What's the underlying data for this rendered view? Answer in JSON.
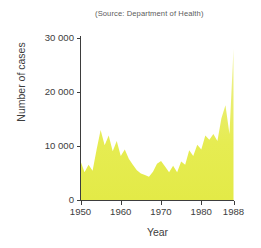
{
  "figure": {
    "source_note": "(Source: Department of Health)",
    "background_color": "#ffffff",
    "axis_color": "#3d3d3d"
  },
  "chart_data": {
    "type": "area",
    "title": "",
    "subtitle": "(Source: Department of Health)",
    "xlabel": "Year",
    "ylabel": "Number of cases",
    "xlim": [
      1950,
      1988
    ],
    "ylim": [
      0,
      31000
    ],
    "grid": false,
    "legend": null,
    "fill_color": "#e6ec49",
    "x_tick_labels": [
      "1950",
      "1960",
      "1970",
      "1980",
      "1988"
    ],
    "x_ticks": [
      1950,
      1960,
      1970,
      1980,
      1988
    ],
    "y_tick_labels": [
      "0",
      "10 000",
      "20 000",
      "30 000"
    ],
    "y_ticks": [
      0,
      10000,
      20000,
      30000
    ],
    "x": [
      1950,
      1951,
      1952,
      1953,
      1954,
      1955,
      1956,
      1957,
      1958,
      1959,
      1960,
      1961,
      1962,
      1963,
      1964,
      1965,
      1966,
      1967,
      1968,
      1969,
      1970,
      1971,
      1972,
      1973,
      1974,
      1975,
      1976,
      1977,
      1978,
      1979,
      1980,
      1981,
      1982,
      1983,
      1984,
      1985,
      1986,
      1987,
      1988
    ],
    "values": [
      7300,
      5200,
      6600,
      5500,
      9400,
      13000,
      10200,
      12000,
      9100,
      11000,
      8200,
      9400,
      7700,
      6600,
      5600,
      5000,
      4700,
      4400,
      5300,
      6800,
      7300,
      6300,
      5200,
      6400,
      5200,
      7200,
      6600,
      9300,
      8200,
      10300,
      9400,
      12000,
      11200,
      12300,
      11000,
      15200,
      17600,
      12300,
      28000
    ],
    "series": [
      {
        "name": "Number of cases",
        "values": [
          7300,
          5200,
          6600,
          5500,
          9400,
          13000,
          10200,
          12000,
          9100,
          11000,
          8200,
          9400,
          7700,
          6600,
          5600,
          5000,
          4700,
          4400,
          5300,
          6800,
          7300,
          6300,
          5200,
          6400,
          5200,
          7200,
          6600,
          9300,
          8200,
          10300,
          9400,
          12000,
          11200,
          12300,
          11000,
          15200,
          17600,
          12300,
          28000
        ]
      }
    ],
    "annotations": [
      "(Source: Department of Health)"
    ]
  }
}
